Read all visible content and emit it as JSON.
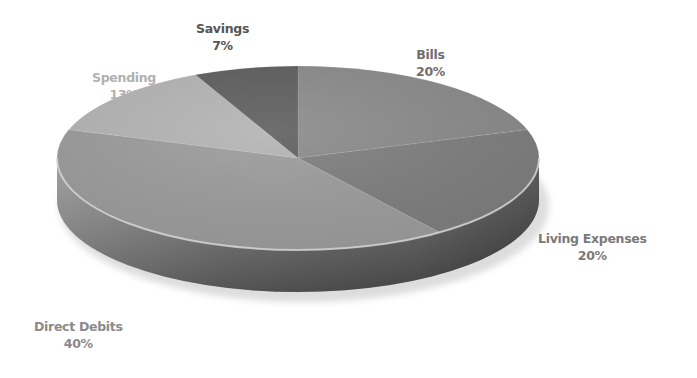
{
  "chart_data": {
    "type": "pie",
    "style": "3d",
    "title": "",
    "slices": [
      {
        "label": "Bills",
        "value": 20,
        "display": "20%",
        "color": "#8a8a8a",
        "label_color": "#6e6e6e"
      },
      {
        "label": "Living Expenses",
        "value": 20,
        "display": "20%",
        "color": "#7e7e7e",
        "label_color": "#7a7a7a"
      },
      {
        "label": "Direct Debits",
        "value": 40,
        "display": "40%",
        "color": "#9c9c9c",
        "label_color": "#8a8a8a"
      },
      {
        "label": "Spending",
        "value": 13,
        "display": "13%",
        "color": "#b4b4b4",
        "label_color": "#b0b0b0"
      },
      {
        "label": "Savings",
        "value": 7,
        "display": "7%",
        "color": "#5e5e5e",
        "label_color": "#555555"
      }
    ],
    "start_angle_deg": 0,
    "direction": "clockwise",
    "legend": "none",
    "data_labels": "category and percentage"
  },
  "labels": {
    "bills": {
      "name": "Bills",
      "pct": "20%"
    },
    "living": {
      "name": "Living Expenses",
      "pct": "20%"
    },
    "direct": {
      "name": "Direct Debits",
      "pct": "40%"
    },
    "spending": {
      "name": "Spending",
      "pct": "13%"
    },
    "savings": {
      "name": "Savings",
      "pct": "7%"
    }
  }
}
